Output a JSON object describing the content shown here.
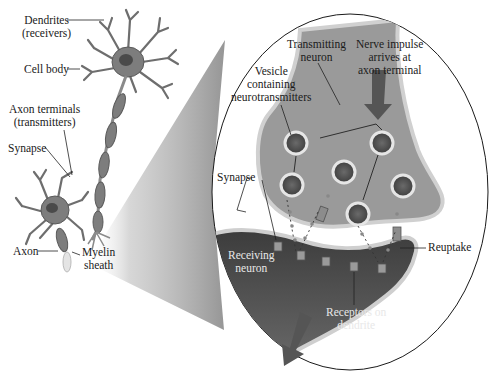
{
  "diagram": {
    "overview_labels": {
      "dendrites": [
        "Dendrites",
        "(receivers)"
      ],
      "cell_body": "Cell body",
      "axon_terminals": [
        "Axon terminals",
        "(transmitters)"
      ],
      "synapse": "Synapse",
      "axon": "Axon",
      "myelin_sheath": [
        "Myelin",
        "sheath"
      ]
    },
    "detail_labels": {
      "transmitting_neuron": [
        "Transmitting",
        "neuron"
      ],
      "nerve_impulse": [
        "Nerve impulse",
        "arrives at",
        "axon terminal"
      ],
      "vesicle": [
        "Vesicle",
        "containing",
        "neurotransmitters"
      ],
      "synapse": "Synapse",
      "reuptake": "Reuptake",
      "receiving_neuron": [
        "Receiving",
        "neuron"
      ],
      "receptors": [
        "Receptors on",
        "dendrite"
      ]
    },
    "colors": {
      "neuron_fill": "#8a8a8a",
      "neuron_dark": "#4a4a4a",
      "membrane": "#c8c8c8",
      "vesicle_fill": "#5a5a5a",
      "arrow": "#555555",
      "outline": "#222222"
    }
  }
}
